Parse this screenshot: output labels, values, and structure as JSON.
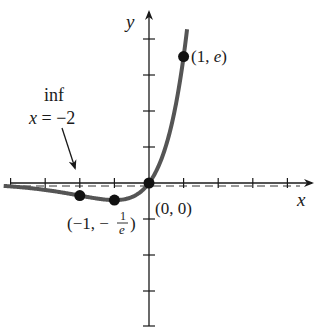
{
  "chart_data": {
    "type": "line",
    "title": "",
    "function": "y = x·e^x",
    "xlabel": "x",
    "ylabel": "y",
    "xlim": [
      -4.2,
      4.6
    ],
    "ylim": [
      -3,
      3.4
    ],
    "grid": false,
    "x_ticks": [
      -4,
      -3,
      -2,
      -1,
      1,
      2,
      3,
      4
    ],
    "asymptote": {
      "type": "horizontal",
      "y": 0,
      "style": "dashed"
    },
    "series": [
      {
        "name": "x e^x",
        "color": "#555555",
        "x": [
          -4.2,
          -4,
          -3.5,
          -3,
          -2.5,
          -2,
          -1.5,
          -1,
          -0.5,
          0,
          0.25,
          0.5,
          0.75,
          1,
          1.1
        ],
        "y": [
          -0.063,
          -0.073,
          -0.106,
          -0.149,
          -0.205,
          -0.271,
          -0.335,
          -0.368,
          -0.303,
          0,
          0.321,
          0.824,
          1.588,
          2.718,
          3.305
        ]
      }
    ],
    "points": [
      {
        "x": -2,
        "y": -0.271,
        "label": ""
      },
      {
        "x": -1,
        "y": -0.368,
        "label": "(−1, −1/e)"
      },
      {
        "x": 0,
        "y": 0,
        "label": "(0, 0)"
      },
      {
        "x": 1,
        "y": 2.718,
        "label": "(1, e)"
      }
    ],
    "annotations": [
      {
        "text": "inf",
        "line2": "x = −2",
        "target": {
          "x": -2,
          "y": 0
        },
        "meaning": "inflection point at x = −2"
      }
    ]
  },
  "labels": {
    "x_axis": "x",
    "y_axis": "y",
    "point_max": "(1, ",
    "point_max_e": "e",
    "point_max_close": ")",
    "point_origin": "(0, 0)",
    "point_min_prefix": "(−1, −",
    "point_min_num": "1",
    "point_min_den": "e",
    "point_min_close": ")",
    "annot_line1": "inf",
    "annot_line2_x": "x",
    "annot_line2_rest": " = −2"
  }
}
